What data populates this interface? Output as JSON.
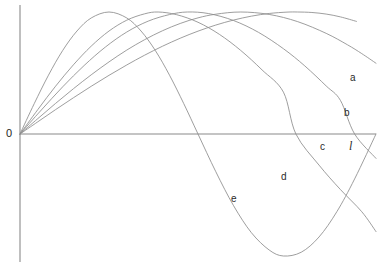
{
  "figure": {
    "title": "",
    "background_color": "#ffffff",
    "width": 379,
    "height": 266
  },
  "axes": {
    "origin_label": "0",
    "origin_label_x": 6,
    "origin_label_y": 128,
    "x_axis": {
      "x1": 20,
      "y1": 134,
      "x2": 376,
      "y2": 134,
      "color": "#8a8a8a"
    },
    "y_axis": {
      "x1": 20,
      "y1": 5,
      "x2": 20,
      "y2": 262,
      "color": "#8a8a8a"
    },
    "x_axis_label": "",
    "y_axis_label": ""
  },
  "labels": [
    {
      "id": "label-a",
      "text": "a",
      "x": 350,
      "y": 73,
      "italic": false
    },
    {
      "id": "label-b",
      "text": "b",
      "x": 344,
      "y": 108,
      "italic": false
    },
    {
      "id": "label-c",
      "text": "c",
      "x": 320,
      "y": 142,
      "italic": false
    },
    {
      "id": "label-l",
      "text": "l",
      "x": 349,
      "y": 140,
      "italic": true
    },
    {
      "id": "label-d",
      "text": "d",
      "x": 281,
      "y": 172,
      "italic": false
    },
    {
      "id": "label-e",
      "text": "e",
      "x": 231,
      "y": 194,
      "italic": false
    }
  ],
  "chart_data": {
    "type": "line",
    "title": "",
    "subtitle": "",
    "xlabel": "",
    "ylabel": "",
    "xlim": [
      0,
      1.0
    ],
    "ylim": [
      -1.0,
      1.0
    ],
    "grid": false,
    "legend": "inline-end-labels",
    "axis_pixel_frame": {
      "origin_px": [
        20,
        134
      ],
      "x_unit_px": 356,
      "y_unit_px": 122,
      "note": "x = 1.0 corresponds to the point labelled l at pixel x = 376; y = +1 is pixel y = 12"
    },
    "series": [
      {
        "name": "a",
        "label": "a",
        "color": "#8d8d8d",
        "form": "sin(pi*x/(2*0.78))",
        "zero_crossings_x": [
          0.0
        ],
        "peak": {
          "x": 0.78,
          "y": 1.0
        },
        "end": {
          "x": 0.945,
          "y": 0.28
        },
        "points": [
          [
            0.0,
            0.0
          ],
          [
            0.05,
            0.1
          ],
          [
            0.1,
            0.2
          ],
          [
            0.15,
            0.297
          ],
          [
            0.2,
            0.391
          ],
          [
            0.25,
            0.481
          ],
          [
            0.3,
            0.566
          ],
          [
            0.35,
            0.646
          ],
          [
            0.4,
            0.719
          ],
          [
            0.45,
            0.785
          ],
          [
            0.5,
            0.843
          ],
          [
            0.55,
            0.893
          ],
          [
            0.6,
            0.934
          ],
          [
            0.65,
            0.966
          ],
          [
            0.7,
            0.988
          ],
          [
            0.75,
            0.999
          ],
          [
            0.78,
            1.0
          ],
          [
            0.82,
            0.996
          ],
          [
            0.86,
            0.983
          ],
          [
            0.9,
            0.96
          ],
          [
            0.945,
            0.923
          ]
        ]
      },
      {
        "name": "b",
        "label": "b",
        "color": "#8d8d8d",
        "form": "sin(pi*x/(2*0.62))",
        "peak": {
          "x": 0.62,
          "y": 1.0
        },
        "zero_crossings_x": [
          0.0,
          1.0
        ],
        "end": {
          "x": 1.0,
          "y": 0.0
        },
        "points": [
          [
            0.0,
            0.0
          ],
          [
            0.05,
            0.126
          ],
          [
            0.1,
            0.251
          ],
          [
            0.15,
            0.371
          ],
          [
            0.2,
            0.485
          ],
          [
            0.25,
            0.591
          ],
          [
            0.3,
            0.688
          ],
          [
            0.35,
            0.773
          ],
          [
            0.4,
            0.846
          ],
          [
            0.45,
            0.906
          ],
          [
            0.5,
            0.952
          ],
          [
            0.55,
            0.982
          ],
          [
            0.62,
            1.0
          ],
          [
            0.7,
            0.98
          ],
          [
            0.78,
            0.921
          ],
          [
            0.86,
            0.825
          ],
          [
            0.92,
            0.731
          ],
          [
            0.96,
            0.659
          ],
          [
            1.0,
            0.58
          ]
        ]
      },
      {
        "name": "c",
        "label": "c",
        "color": "#8d8d8d",
        "form": "sin(pi*x/0.94)",
        "peak": {
          "x": 0.47,
          "y": 1.0
        },
        "zero_crossings_x": [
          0.0,
          0.94
        ],
        "end": {
          "x": 1.0,
          "y": -0.2
        },
        "points": [
          [
            0.0,
            0.0
          ],
          [
            0.06,
            0.197
          ],
          [
            0.12,
            0.387
          ],
          [
            0.18,
            0.561
          ],
          [
            0.24,
            0.713
          ],
          [
            0.3,
            0.836
          ],
          [
            0.36,
            0.925
          ],
          [
            0.42,
            0.979
          ],
          [
            0.47,
            1.0
          ],
          [
            0.53,
            0.987
          ],
          [
            0.6,
            0.93
          ],
          [
            0.67,
            0.833
          ],
          [
            0.74,
            0.699
          ],
          [
            0.8,
            0.558
          ],
          [
            0.86,
            0.394
          ],
          [
            0.9,
            0.276
          ],
          [
            0.94,
            0.0
          ],
          [
            1.0,
            -0.2
          ]
        ]
      },
      {
        "name": "d",
        "label": "d",
        "color": "#8d8d8d",
        "form": "sin(pi*x/0.775)",
        "peak": {
          "x": 0.388,
          "y": 1.0
        },
        "zero_crossings_x": [
          0.0,
          0.775
        ],
        "minimum": {
          "x": 1.16,
          "y": -1.0
        },
        "end": {
          "x": 1.0,
          "y": -0.8
        },
        "points": [
          [
            0.0,
            0.0
          ],
          [
            0.05,
            0.2
          ],
          [
            0.1,
            0.392
          ],
          [
            0.15,
            0.567
          ],
          [
            0.2,
            0.72
          ],
          [
            0.25,
            0.844
          ],
          [
            0.3,
            0.933
          ],
          [
            0.35,
            0.985
          ],
          [
            0.388,
            1.0
          ],
          [
            0.44,
            0.978
          ],
          [
            0.5,
            0.916
          ],
          [
            0.56,
            0.817
          ],
          [
            0.62,
            0.685
          ],
          [
            0.68,
            0.525
          ],
          [
            0.74,
            0.343
          ],
          [
            0.775,
            0.0
          ],
          [
            0.84,
            -0.255
          ],
          [
            0.9,
            -0.455
          ],
          [
            0.96,
            -0.637
          ],
          [
            1.0,
            -0.8
          ]
        ]
      },
      {
        "name": "e",
        "label": "e",
        "color": "#8d8d8d",
        "form": "sin(pi*x/0.50)",
        "peak": {
          "x": 0.25,
          "y": 1.0
        },
        "zero_crossings_x": [
          0.0,
          0.5,
          1.0
        ],
        "minimum": {
          "x": 0.74,
          "y": -1.0
        },
        "end": {
          "x": 1.0,
          "y": 0.02
        },
        "points": [
          [
            0.0,
            0.0
          ],
          [
            0.04,
            0.249
          ],
          [
            0.08,
            0.482
          ],
          [
            0.12,
            0.685
          ],
          [
            0.16,
            0.844
          ],
          [
            0.2,
            0.951
          ],
          [
            0.25,
            1.0
          ],
          [
            0.3,
            0.951
          ],
          [
            0.34,
            0.844
          ],
          [
            0.38,
            0.685
          ],
          [
            0.42,
            0.482
          ],
          [
            0.46,
            0.249
          ],
          [
            0.5,
            0.0
          ],
          [
            0.55,
            -0.309
          ],
          [
            0.6,
            -0.588
          ],
          [
            0.65,
            -0.809
          ],
          [
            0.7,
            -0.951
          ],
          [
            0.74,
            -1.0
          ],
          [
            0.79,
            -0.969
          ],
          [
            0.84,
            -0.844
          ],
          [
            0.89,
            -0.637
          ],
          [
            0.94,
            -0.368
          ],
          [
            1.0,
            0.0
          ]
        ]
      }
    ]
  }
}
